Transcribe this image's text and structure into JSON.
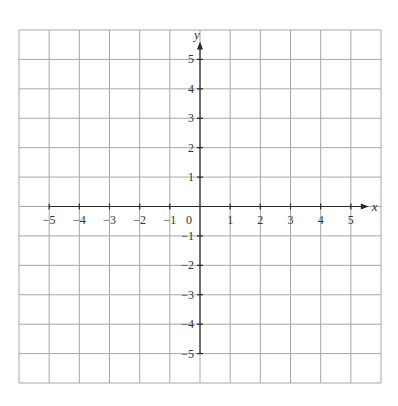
{
  "diagram": {
    "type": "coordinate-grid",
    "grid": {
      "x_min": -6,
      "x_max": 6,
      "y_min": -6,
      "y_max": 6,
      "cell_count_x": 12,
      "cell_count_y": 12,
      "line_color": "#a8a8a8"
    },
    "axes": {
      "color": "#2a2a2a",
      "x_label": "x",
      "y_label": "y",
      "x_axis_range": [
        -5,
        5
      ],
      "y_axis_range": [
        -5,
        5
      ]
    },
    "x_ticks": [
      {
        "value": -5,
        "label": "−5"
      },
      {
        "value": -4,
        "label": "−4"
      },
      {
        "value": -3,
        "label": "−3"
      },
      {
        "value": -2,
        "label": "−2"
      },
      {
        "value": -1,
        "label": "−1"
      },
      {
        "value": 1,
        "label": "1"
      },
      {
        "value": 2,
        "label": "2"
      },
      {
        "value": 3,
        "label": "3"
      },
      {
        "value": 4,
        "label": "4"
      },
      {
        "value": 5,
        "label": "5"
      }
    ],
    "y_ticks": [
      {
        "value": 5,
        "label": "5"
      },
      {
        "value": 4,
        "label": "4"
      },
      {
        "value": 3,
        "label": "3"
      },
      {
        "value": 2,
        "label": "2"
      },
      {
        "value": 1,
        "label": "1"
      },
      {
        "value": -1,
        "label": "−1"
      },
      {
        "value": -2,
        "label": "−2"
      },
      {
        "value": -3,
        "label": "−3"
      },
      {
        "value": -4,
        "label": "−4"
      },
      {
        "value": -5,
        "label": "−5"
      }
    ],
    "origin_label": "0"
  }
}
